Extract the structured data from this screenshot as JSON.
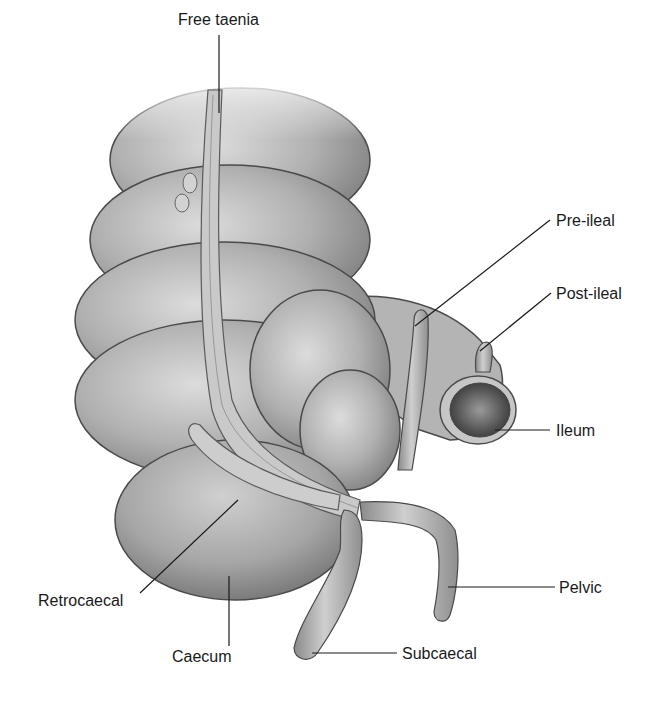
{
  "figure": {
    "labels": {
      "free_taenia": "Free taenia",
      "pre_ileal": "Pre-ileal",
      "post_ileal": "Post-ileal",
      "ileum": "Ileum",
      "retrocaecal": "Retrocaecal",
      "caecum": "Caecum",
      "pelvic": "Pelvic",
      "subcaecal": "Subcaecal"
    },
    "colors": {
      "background": "#ffffff",
      "tissue_light": "#d4d4d4",
      "tissue_mid": "#a8a8a8",
      "tissue_dark": "#6e6e6e",
      "outline": "#4a4a4a",
      "leader_line": "#1a1a1a",
      "text": "#1a1a1a"
    }
  }
}
